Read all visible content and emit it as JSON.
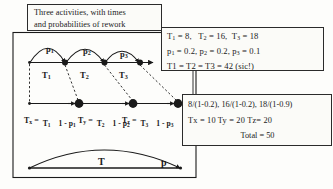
{
  "figure": {
    "caption_box": {
      "lines": [
        "Three activities, with times",
        "and probabilities of rework"
      ]
    },
    "params_box": {
      "line1": "T1 = 8,   T2 = 16,  T3 = 18",
      "line1_parts": {
        "t1_name": "T",
        "t1_sub": "1",
        "t1_eq": " = 8,",
        "t2_name": "T",
        "t2_sub": "2",
        "t2_eq": " = 16,",
        "t3_name": "T",
        "t3_sub": "3",
        "t3_eq": " = 18"
      },
      "line2_parts": {
        "p1_name": "p",
        "p1_sub": "1",
        "p1_eq": " = 0.2,",
        "p2_name": "p",
        "p2_sub": "2",
        "p2_eq": " = 0.2,",
        "p3_name": "p",
        "p3_sub": "3",
        "p3_eq": " = 0.1"
      },
      "line3": "T1 = T2 = T3 = 42 (sic!)"
    },
    "results_box": {
      "line1": "8/(1-0.2), 16/(1-0.2), 18/(1-0.9)",
      "line2": "Tx  = 10      Ty = 20      Tz= 20",
      "line3": "Total = 50"
    },
    "top_chain": {
      "rework_labels": [
        {
          "name": "p",
          "sub": "1"
        },
        {
          "name": "p",
          "sub": "2"
        },
        {
          "name": "p",
          "sub": "3"
        }
      ],
      "activity_labels": [
        {
          "name": "T",
          "sub": "1"
        },
        {
          "name": "T",
          "sub": "2"
        },
        {
          "name": "T",
          "sub": "3"
        }
      ]
    },
    "formulas": [
      {
        "lhs_name": "T",
        "lhs_sub": "x",
        "eq": "=",
        "num_name": "T",
        "num_sub": "1",
        "den": "1 - p",
        "den_sub": "1"
      },
      {
        "lhs_name": "T",
        "lhs_sub": "y",
        "eq": "=",
        "num_name": "T",
        "num_sub": "2",
        "den": "1 - p",
        "den_sub": "2"
      },
      {
        "lhs_name": "T",
        "lhs_sub": "z",
        "eq": "=",
        "num_name": "T",
        "num_sub": "3",
        "den": "1 - p",
        "den_sub": "3"
      }
    ],
    "bottom_chain": {
      "time_label": "T",
      "prob_label": "p"
    },
    "colors": {
      "ink": "#1a1a1a",
      "paper": "#fdfdfb",
      "box_fill": "#fbfbf8"
    }
  }
}
